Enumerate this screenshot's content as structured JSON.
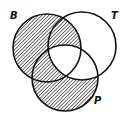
{
  "diagram": {
    "type": "venn",
    "sets": [
      {
        "id": "B",
        "label": "B"
      },
      {
        "id": "T",
        "label": "T"
      },
      {
        "id": "P",
        "label": "P"
      }
    ],
    "regions": [
      {
        "sets": [
          "B"
        ],
        "shaded": true
      },
      {
        "sets": [
          "T"
        ],
        "shaded": false
      },
      {
        "sets": [
          "P"
        ],
        "shaded": true
      },
      {
        "sets": [
          "B",
          "T"
        ],
        "shaded": true
      },
      {
        "sets": [
          "B",
          "P"
        ],
        "shaded": true
      },
      {
        "sets": [
          "T",
          "P"
        ],
        "shaded": false
      },
      {
        "sets": [
          "B",
          "T",
          "P"
        ],
        "shaded": false
      }
    ],
    "colors": {
      "stroke": "#111111",
      "hatch": "#333333",
      "background": "#ffffff"
    }
  }
}
